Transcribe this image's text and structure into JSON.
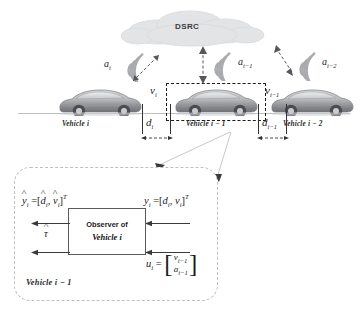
{
  "figure": {
    "background": "#ffffff",
    "line_color": "#333333",
    "accent": "#5b5b5b"
  },
  "top_scene": {
    "cloud_label": "DSRC",
    "vehicles": [
      {
        "id": "vehicle-i",
        "label": "Vehicle i",
        "accel_label": "a",
        "accel_sub": "i",
        "vel_label": "v",
        "vel_sub": "i"
      },
      {
        "id": "vehicle-i-1",
        "label": "Vehicle i − 1",
        "accel_label": "a",
        "accel_sub": "i−1",
        "vel_label": "v",
        "vel_sub": "i−1"
      },
      {
        "id": "vehicle-i-2",
        "label": "Vehicle i − 2",
        "accel_label": "a",
        "accel_sub": "i−2",
        "vel_label": "",
        "vel_sub": ""
      }
    ],
    "distances": [
      {
        "id": "d-i",
        "label": "d",
        "sub": "i"
      },
      {
        "id": "d-i-1",
        "label": "d",
        "sub": "i−1"
      }
    ]
  },
  "observer_panel": {
    "panel_label": "Vehicle i − 1",
    "box": {
      "line1": "Observer of",
      "line2": "Vehicle i"
    },
    "outputs": {
      "estimate": {
        "base": "y",
        "sub": "i",
        "eq": "=",
        "open": "[",
        "e1": "d",
        "e1sub": "i",
        "comma": ",",
        "e2": "v",
        "e2sub": "i",
        "close": "]",
        "sup": "T"
      },
      "tau": {
        "base": "τ"
      }
    },
    "inputs": {
      "measurement": {
        "base": "y",
        "sub": "i",
        "eq": "=",
        "open": "[",
        "e1": "d",
        "e1sub": "i",
        "comma": ",",
        "e2": "v",
        "e2sub": "i",
        "close": "]",
        "sup": "T"
      },
      "control": {
        "base": "u",
        "sub": "i",
        "eq": "=",
        "row1": "v",
        "row1sub": "i−1",
        "row2": "a",
        "row2sub": "i−1"
      }
    }
  }
}
